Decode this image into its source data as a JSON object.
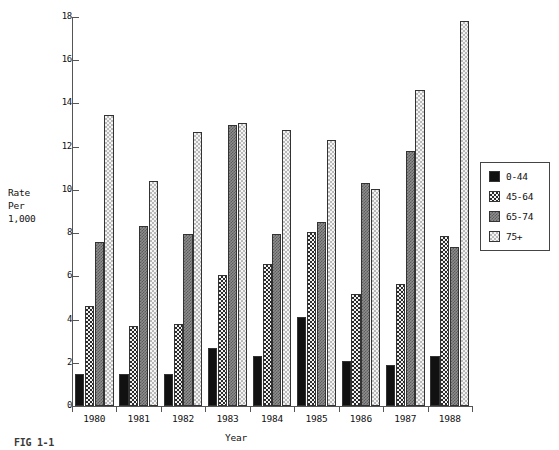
{
  "figure": {
    "caption": "FIG 1-1"
  },
  "chart_data": {
    "type": "bar",
    "title": "",
    "xlabel": "Year",
    "ylabel": "Rate\nPer\n1,000",
    "ylabel_lines": [
      "Rate",
      "Per",
      "1,000"
    ],
    "categories": [
      "1980",
      "1981",
      "1982",
      "1983",
      "1984",
      "1985",
      "1986",
      "1987",
      "1988"
    ],
    "ylim": [
      0,
      18
    ],
    "yticks": [
      0,
      2,
      4,
      6,
      8,
      10,
      12,
      14,
      16,
      18
    ],
    "ytick_labels": [
      "0",
      "2",
      "4",
      "6",
      "8",
      "10",
      "12",
      "14",
      "16",
      "18"
    ],
    "grid": false,
    "legend_position": "right",
    "series": [
      {
        "name": "0-44",
        "color": "#111111",
        "pattern": "solid",
        "values": [
          1.5,
          1.5,
          1.5,
          2.7,
          2.3,
          4.1,
          2.1,
          1.9,
          2.3
        ]
      },
      {
        "name": "45-64",
        "color": "#2a2a2a",
        "pattern": "dark-checker",
        "values": [
          4.65,
          3.7,
          3.8,
          6.05,
          6.55,
          8.05,
          5.2,
          5.65,
          7.85
        ]
      },
      {
        "name": "65-74",
        "color": "#8d8d8d",
        "pattern": "mid-checker",
        "values": [
          7.6,
          8.35,
          7.95,
          13.0,
          7.95,
          8.5,
          10.3,
          11.8,
          7.35
        ]
      },
      {
        "name": "75+",
        "color": "#b9b9b9",
        "pattern": "light-checker",
        "values": [
          13.45,
          10.4,
          12.7,
          13.1,
          12.75,
          12.3,
          10.05,
          14.6,
          17.8
        ]
      }
    ]
  }
}
